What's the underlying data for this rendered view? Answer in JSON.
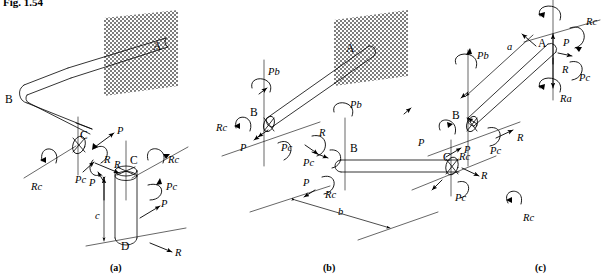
{
  "figure": {
    "number_label": "Fig. 1.54",
    "panels": [
      {
        "id": "a",
        "caption": "(a)"
      },
      {
        "id": "b",
        "caption": "(b)"
      },
      {
        "id": "c",
        "caption": "(c)"
      }
    ]
  },
  "colors": {
    "ink": "#000000",
    "wall_fill": "#9a9a9a",
    "paper": "#ffffff",
    "bar_fill": "#ffffff"
  },
  "panel_a": {
    "caption": "(a)",
    "joints": [
      {
        "name": "point-A",
        "text": "A"
      },
      {
        "name": "point-B",
        "text": "B"
      },
      {
        "name": "point-C-left",
        "text": "C"
      },
      {
        "name": "point-C-right",
        "text": "C"
      },
      {
        "name": "point-D",
        "text": "D"
      }
    ],
    "dimensions": [
      {
        "name": "length-c",
        "text": "c"
      }
    ],
    "loads": [
      {
        "name": "force-P-top",
        "text": "P"
      },
      {
        "name": "moment-R-upper",
        "text": "R"
      },
      {
        "name": "moment-Pc-left",
        "text": "Pc"
      },
      {
        "name": "moment-Rc-left",
        "text": "Rc"
      },
      {
        "name": "force-R-mid",
        "text": "R"
      },
      {
        "name": "moment-Rc-right",
        "text": "Rc"
      },
      {
        "name": "moment-Pc-right",
        "text": "Pc"
      },
      {
        "name": "force-P-lower-left",
        "text": "P"
      },
      {
        "name": "force-P-lower-right",
        "text": "P"
      },
      {
        "name": "force-R-bottom",
        "text": "R"
      }
    ]
  },
  "panel_b": {
    "caption": "(b)",
    "joints": [
      {
        "name": "point-A",
        "text": "A"
      },
      {
        "name": "point-B-upper",
        "text": "B"
      },
      {
        "name": "point-B-lower",
        "text": "B"
      },
      {
        "name": "point-C",
        "text": "C"
      }
    ],
    "dimensions": [
      {
        "name": "length-b",
        "text": "b"
      }
    ],
    "loads": [
      {
        "name": "moment-Pb-upper",
        "text": "Pb"
      },
      {
        "name": "moment-Rc-upper-left",
        "text": "Rc"
      },
      {
        "name": "force-P-upper-left",
        "text": "P"
      },
      {
        "name": "moment-Pc-upper",
        "text": "Pc"
      },
      {
        "name": "moment-R-upper",
        "text": "R"
      },
      {
        "name": "moment-Pc-lower",
        "text": "Pc"
      },
      {
        "name": "moment-Pb-lower",
        "text": "Pb"
      },
      {
        "name": "force-P-mid",
        "text": "P"
      },
      {
        "name": "moment-Rc-mid",
        "text": "Rc"
      },
      {
        "name": "moment-Rc-right",
        "text": "Rc"
      },
      {
        "name": "force-P-right",
        "text": "P"
      },
      {
        "name": "force-R-right",
        "text": "R"
      },
      {
        "name": "moment-Pc-right",
        "text": "Pc"
      }
    ]
  },
  "panel_c": {
    "caption": "(c)",
    "joints": [
      {
        "name": "point-A",
        "text": "A"
      },
      {
        "name": "point-B",
        "text": "B"
      }
    ],
    "dimensions": [
      {
        "name": "length-a",
        "text": "a"
      }
    ],
    "loads": [
      {
        "name": "moment-Rc-top-right",
        "text": "Rc"
      },
      {
        "name": "force-P-top",
        "text": "P"
      },
      {
        "name": "force-R-top",
        "text": "R"
      },
      {
        "name": "moment-Pc-top-right",
        "text": "Pc"
      },
      {
        "name": "moment-Ra",
        "text": "Ra"
      },
      {
        "name": "moment-Pb",
        "text": "Pb"
      },
      {
        "name": "force-P-left",
        "text": "P"
      },
      {
        "name": "moment-Rc-left",
        "text": "Rc"
      },
      {
        "name": "moment-Pc-lower",
        "text": "Pc"
      },
      {
        "name": "force-R-lower",
        "text": "R"
      }
    ]
  }
}
